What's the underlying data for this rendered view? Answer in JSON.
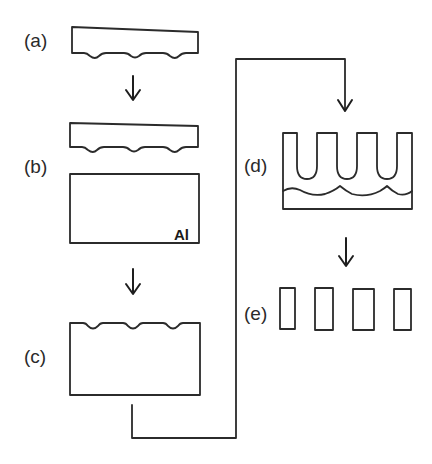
{
  "diagram": {
    "type": "process-flow",
    "steps": [
      {
        "id": "a",
        "label": "(a)",
        "description": "Stamp (mold) with convex bumps on bottom surface"
      },
      {
        "id": "b",
        "label": "(b)",
        "description": "Stamp pressed onto aluminium substrate",
        "material_label": "Al"
      },
      {
        "id": "c",
        "label": "(c)",
        "description": "Aluminium with imprinted concave pits on top surface"
      },
      {
        "id": "d",
        "label": "(d)",
        "description": "Anodized ordered pore array above barrier layer"
      },
      {
        "id": "e",
        "label": "(e)",
        "description": "Separated pillar/tube structures"
      }
    ],
    "arrows": [
      {
        "from": "a",
        "to": "b",
        "icon": "down-arrow-icon"
      },
      {
        "from": "b",
        "to": "c",
        "icon": "down-arrow-icon"
      },
      {
        "from": "c",
        "to": "d",
        "icon": "elbow-connector-arrow-icon"
      },
      {
        "from": "d",
        "to": "e",
        "icon": "down-arrow-icon"
      }
    ],
    "colors": {
      "stroke": "#2b2b2b",
      "text": "#2a2a2a",
      "background": "#ffffff"
    }
  }
}
